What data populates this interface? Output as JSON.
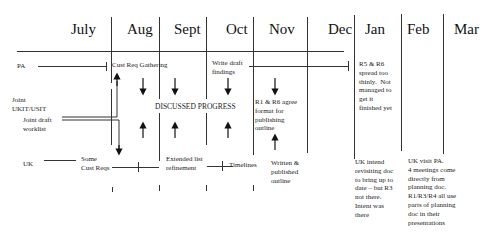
{
  "months": [
    "July",
    "Aug",
    "Sept",
    "Oct",
    "Nov",
    "Dec",
    "Jan",
    "Feb",
    "Mar"
  ],
  "rows": {
    "pa": "PA",
    "joint": "Joint\nUKIT/USIT",
    "joint_draft": "Joint draft\nworklist",
    "uk": "UK"
  },
  "pa_row": {
    "cust_req_gathering": "Cust Req Gathering",
    "write_draft_findings": "Write draft\nfindings",
    "jan_note": "R5 & R6\nspread too\nthinly.  Not\nmanaged to\nget it\nfinished yet"
  },
  "joint_row": {
    "discussed_progress": "DISCUSSED PROGRESS",
    "nov_note": "R1 & R6 agree\nformat for\npublishing\noutline"
  },
  "uk_row": {
    "some_cust_reqs": "Some\nCust Reqs",
    "extended_list": "Extended list\nrefinement",
    "timelines": "Timelines",
    "written_published": "Written &\npublished\noutline",
    "jan_note": "UK intend\nrevisiting doc\nto bring up to\ndate – but R3\nnot there.\nIntent was\nthere",
    "feb_note": "UK visit PA.\n4 meetings come\ndirectly from\nplanning doc.\nR1/R3/R4 all use\nparts of planning\ndoc in their\npresentations"
  }
}
